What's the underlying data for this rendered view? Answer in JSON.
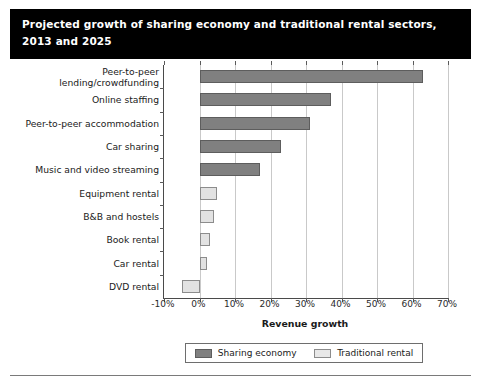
{
  "title": {
    "line1": "Projected growth of sharing economy and traditional rental sectors,",
    "line2": "2013 and 2025"
  },
  "legend": {
    "items": [
      {
        "label": "Sharing economy",
        "color": "#808080",
        "key": "sharing"
      },
      {
        "label": "Traditional rental",
        "color": "#e8e8e8",
        "key": "traditional"
      }
    ]
  },
  "colors": {
    "sharing": "#808080",
    "traditional": "#e2e2e2",
    "banner": "#000000",
    "grid": "#c9c9c9",
    "axis": "#4a4a4a"
  },
  "axis": {
    "x_title": "Revenue growth",
    "ticks": [
      "-10%",
      "0%",
      "10%",
      "20%",
      "30%",
      "40%",
      "50%",
      "60%",
      "70%"
    ]
  },
  "chart_data": {
    "type": "bar",
    "orientation": "horizontal",
    "title": "Projected growth of sharing economy and traditional rental sectors, 2013 and 2025",
    "xlabel": "Revenue growth",
    "ylabel": "",
    "xlim": [
      -10,
      70
    ],
    "xticks": [
      -10,
      0,
      10,
      20,
      30,
      40,
      50,
      60,
      70
    ],
    "xtick_labels": [
      "-10%",
      "0%",
      "10%",
      "20%",
      "30%",
      "40%",
      "50%",
      "60%",
      "70%"
    ],
    "grid": true,
    "legend_position": "bottom",
    "categories": [
      "Peer-to-peer\nlending/crowdfunding",
      "Online staffing",
      "Peer-to-peer accommodation",
      "Car sharing",
      "Music and video streaming",
      "Equipment rental",
      "B&B and hostels",
      "Book rental",
      "Car rental",
      "DVD rental"
    ],
    "series": [
      {
        "name": "Sharing economy",
        "color": "#808080",
        "values": [
          63,
          37,
          31,
          23,
          17,
          null,
          null,
          null,
          null,
          null
        ]
      },
      {
        "name": "Traditional rental",
        "color": "#e2e2e2",
        "values": [
          null,
          null,
          null,
          null,
          null,
          5,
          4,
          3,
          2,
          -5
        ]
      }
    ],
    "points": [
      {
        "category": "Peer-to-peer lending/crowdfunding",
        "series": "Sharing economy",
        "value": 63
      },
      {
        "category": "Online staffing",
        "series": "Sharing economy",
        "value": 37
      },
      {
        "category": "Peer-to-peer accommodation",
        "series": "Sharing economy",
        "value": 31
      },
      {
        "category": "Car sharing",
        "series": "Sharing economy",
        "value": 23
      },
      {
        "category": "Music and video streaming",
        "series": "Sharing economy",
        "value": 17
      },
      {
        "category": "Equipment rental",
        "series": "Traditional rental",
        "value": 5
      },
      {
        "category": "B&B and hostels",
        "series": "Traditional rental",
        "value": 4
      },
      {
        "category": "Book rental",
        "series": "Traditional rental",
        "value": 3
      },
      {
        "category": "Car rental",
        "series": "Traditional rental",
        "value": 2
      },
      {
        "category": "DVD rental",
        "series": "Traditional rental",
        "value": -5
      }
    ]
  }
}
